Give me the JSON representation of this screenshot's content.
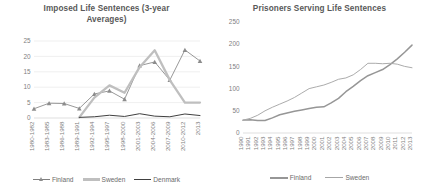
{
  "charts": {
    "left": {
      "title": "Imposed Life Sentences (3-year Averages)",
      "legend": {
        "finland": "Finland",
        "sweden": "Sweden",
        "denmark": "Denmark"
      }
    },
    "right": {
      "title": "Prisoners Serving Life Sentences",
      "legend": {
        "finland": "Finland",
        "sweden": "Sweden"
      }
    }
  },
  "chart_data": [
    {
      "type": "line",
      "title": "Imposed Life Sentences (3-year Averages)",
      "xlabel": "",
      "ylabel": "",
      "ylim": [
        0,
        25
      ],
      "yticks": [
        0,
        5,
        10,
        15,
        20,
        25
      ],
      "grid": true,
      "legend_position": "bottom",
      "categories": [
        "1980-1982",
        "1983-1985",
        "1986-1988",
        "1989-1991",
        "1992-1994",
        "1995-1997",
        "1998-2000",
        "2001-2003",
        "2004-2006",
        "2007-2009",
        "2010-2012",
        "2013"
      ],
      "series": [
        {
          "name": "Finland",
          "marker": "triangle",
          "color": "#8c8c8c",
          "values": [
            3,
            4.8,
            4.7,
            3.1,
            7.8,
            8.8,
            6.1,
            17,
            18.2,
            12.3,
            22.1,
            18.5
          ]
        },
        {
          "name": "Sweden",
          "marker": "none",
          "color": "#bfbfbf",
          "values": [
            null,
            null,
            null,
            0.2,
            6.6,
            10.6,
            8.2,
            16.5,
            22,
            12.3,
            5,
            5
          ]
        },
        {
          "name": "Denmark",
          "marker": "none",
          "color": "#404040",
          "values": [
            null,
            null,
            null,
            0.2,
            0.4,
            0.9,
            0.5,
            1.4,
            0.6,
            0.4,
            1.3,
            0.8
          ]
        }
      ]
    },
    {
      "type": "line",
      "title": "Prisoners Serving Life Sentences",
      "xlabel": "",
      "ylabel": "",
      "ylim": [
        0,
        250
      ],
      "yticks": [
        0,
        50,
        100,
        150,
        200,
        250
      ],
      "grid": false,
      "legend_position": "bottom",
      "categories": [
        "1990",
        "1991",
        "1992",
        "1993",
        "1994",
        "1995",
        "1996",
        "1997",
        "1998",
        "1999",
        "2000",
        "2001",
        "2002",
        "2003",
        "2004",
        "2005",
        "2006",
        "2007",
        "2008",
        "2009",
        "2010",
        "2011",
        "2012",
        "2013"
      ],
      "series": [
        {
          "name": "Finland",
          "color": "#969696",
          "values": [
            29,
            30,
            28,
            28,
            34,
            41,
            45,
            49,
            52,
            55,
            58,
            59,
            68,
            78,
            93,
            105,
            118,
            129,
            136,
            143,
            154,
            167,
            182,
            198
          ]
        },
        {
          "name": "Sweden",
          "color": "#a6a6a6",
          "values": [
            29,
            33,
            40,
            50,
            58,
            65,
            72,
            80,
            90,
            100,
            104,
            108,
            114,
            121,
            124,
            131,
            143,
            157,
            157,
            156,
            157,
            155,
            150,
            147
          ]
        }
      ]
    }
  ]
}
